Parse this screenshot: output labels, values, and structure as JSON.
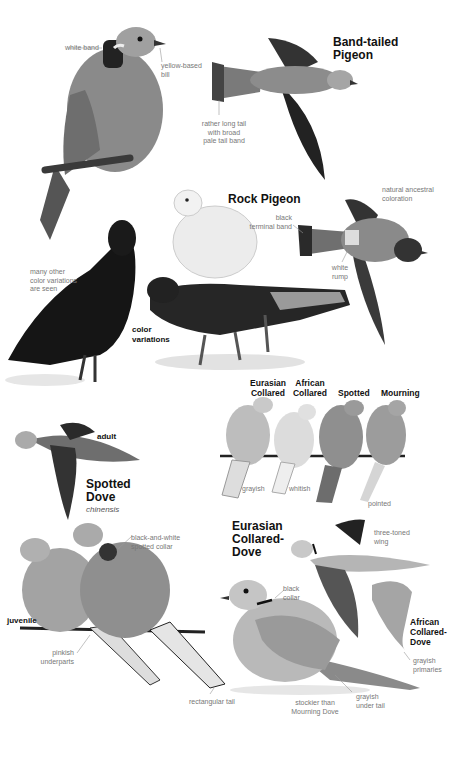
{
  "band_tailed_pigeon": {
    "title": "Band-tailed\nPigeon",
    "notes": {
      "white_band": "white band",
      "yellow_bill": "yellow-based\nbill",
      "tail": "rather long tail\nwith broad\npale tail band"
    }
  },
  "rock_pigeon": {
    "title": "Rock Pigeon",
    "notes": {
      "ancestral": "natural ancestral\ncoloration",
      "black_band": "black\nterminal band",
      "white_rump": "white\nrump",
      "many_variations": "many other\ncolor variations\nare seen"
    },
    "color_variations_label": "color\nvariations"
  },
  "perched_comparison": {
    "species": [
      {
        "name": "Eurasian\nCollared",
        "note": "grayish"
      },
      {
        "name": "African\nCollared",
        "note": "whitish"
      },
      {
        "name": "Spotted",
        "note": ""
      },
      {
        "name": "Mourning",
        "note": "pointed"
      }
    ]
  },
  "spotted_dove": {
    "title": "Spotted\nDove",
    "subspecies": "chinensis",
    "adult_label": "adult",
    "juvenile_label": "juvenile",
    "notes": {
      "collar": "black-and-white\nspotted collar",
      "underparts": "pinkish\nunderparts",
      "tail": "rectangular tail"
    }
  },
  "eurasian_collared_dove": {
    "title": "Eurasian\nCollared-\nDove",
    "notes": {
      "wing": "three-toned\nwing",
      "collar": "black\ncollar",
      "stockier": "stockier than\nMourning Dove",
      "under_tail": "grayish\nunder tail"
    }
  },
  "african_collared_dove": {
    "title": "African\nCollared-\nDove",
    "notes": {
      "primaries": "grayish\nprimaries"
    }
  }
}
